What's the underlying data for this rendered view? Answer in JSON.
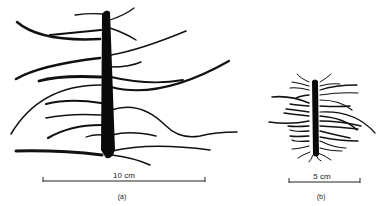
{
  "figure": {
    "panel_a": {
      "scale_label": "10 cm",
      "caption": "(a)"
    },
    "panel_b": {
      "scale_label": "5 cm",
      "caption": "(b)"
    }
  }
}
